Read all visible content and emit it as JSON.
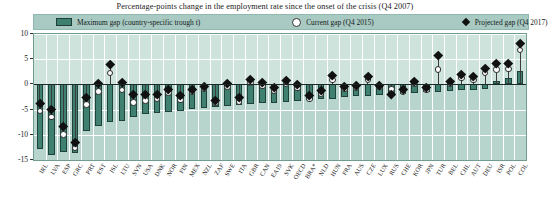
{
  "chart_data": {
    "type": "bar",
    "title": "Percentage-points change in the employment rate since the onset of the crisis (Q4 2007)",
    "xlabel": "",
    "ylabel": "",
    "ylim": [
      -15,
      10
    ],
    "yticks": [
      10,
      5,
      0,
      -5,
      -10,
      -15
    ],
    "grid": true,
    "legend_position": "top",
    "legend": [
      {
        "label": "Maximum gap (country-specific trough t)",
        "marker": "bar"
      },
      {
        "label": "Current gap (Q4 2015)",
        "marker": "open-circle"
      },
      {
        "label": "Projected gap (Q4 2017)",
        "marker": "filled-diamond"
      }
    ],
    "categories": [
      "IRL",
      "LVA",
      "ESP",
      "GRC",
      "PRT",
      "EST",
      "ISL",
      "LTU",
      "SVN",
      "USA",
      "DNK",
      "NOR",
      "FIN",
      "MEX",
      "NZL",
      "ZAF",
      "SWE",
      "ITA",
      "GBR",
      "CAN",
      "EA19",
      "SVK",
      "OECD",
      "BRA*",
      "NLD",
      "HUN",
      "FRA",
      "AUS",
      "CZE",
      "LUX",
      "RUS",
      "CHE",
      "KOR",
      "JPN",
      "TUR",
      "BEL",
      "CHL",
      "AUT",
      "DEU",
      "ISR",
      "POL",
      "COL"
    ],
    "series": [
      {
        "name": "Maximum gap (country-specific trough t)",
        "marker": "bar",
        "values": [
          -12.8,
          -14.0,
          -13.4,
          -13.6,
          -9.2,
          -8.2,
          -7.5,
          -7.3,
          -6.4,
          -5.9,
          -5.6,
          -5.4,
          -5.2,
          -4.9,
          -4.6,
          -4.4,
          -4.2,
          -4.0,
          -3.9,
          -3.7,
          -3.6,
          -3.4,
          -3.2,
          -3.0,
          -2.9,
          -2.8,
          -2.6,
          -2.4,
          -2.3,
          -2.1,
          -2.0,
          -1.9,
          -1.8,
          -1.6,
          -1.5,
          -1.4,
          -1.2,
          -1.1,
          -1.0,
          0.7,
          1.2,
          2.6
        ]
      },
      {
        "name": "Current gap (Q4 2015)",
        "marker": "open-circle",
        "values": [
          -5.3,
          -6.5,
          -9.9,
          -12.6,
          -4.0,
          -1.4,
          2.3,
          -1.1,
          -3.6,
          -3.2,
          -2.9,
          -1.6,
          -3.1,
          -1.4,
          -0.9,
          -3.6,
          -0.4,
          -3.5,
          0.4,
          -0.3,
          -1.3,
          0.1,
          -0.7,
          -2.9,
          -1.9,
          0.9,
          -0.9,
          -0.6,
          1.0,
          -0.5,
          -0.9,
          -1.5,
          0.2,
          -1.1,
          3.0,
          0.1,
          1.3,
          0.9,
          2.3,
          3.0,
          3.1,
          6.8
        ]
      },
      {
        "name": "Projected gap (Q4 2017)",
        "marker": "filled-diamond",
        "values": [
          -3.8,
          -5.0,
          -8.4,
          -11.5,
          -2.6,
          0.2,
          3.9,
          0.4,
          -2.0,
          -2.0,
          -1.9,
          -0.9,
          -2.2,
          -0.9,
          -0.3,
          -3.1,
          0.3,
          -2.6,
          1.0,
          0.4,
          -0.5,
          0.9,
          0.1,
          -2.2,
          -1.1,
          1.9,
          -0.3,
          -0.1,
          1.6,
          -0.2,
          -1.9,
          -1.0,
          0.7,
          -0.5,
          5.8,
          0.6,
          2.1,
          1.6,
          3.2,
          4.1,
          4.2,
          8.2
        ]
      }
    ]
  },
  "colors": {
    "bar": "#3f8071",
    "bar_edge": "#1e4239",
    "plot_bg_positive": "#cfe3dd",
    "plot_bg_negative": "#b8d5cd",
    "legend_bg": "#a9cac2",
    "grid": "#ffffff",
    "zero_line": "#1b2a26",
    "marker_projected": "#111111",
    "marker_current": "#ffffff"
  }
}
